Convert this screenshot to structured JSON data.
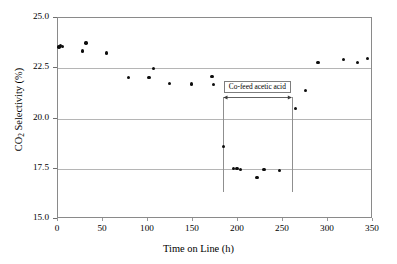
{
  "chart_data": {
    "type": "scatter",
    "title": "",
    "xlabel": "Time on Line (h)",
    "ylabel_parts": {
      "pre": "CO",
      "sub": "2",
      "post": " Selectivity (%)"
    },
    "ylabel": "CO2 Selectivity (%)",
    "xlim": [
      0,
      350
    ],
    "ylim": [
      15.0,
      25.0
    ],
    "xticks": [
      0,
      50,
      100,
      150,
      200,
      250,
      300,
      350
    ],
    "xtick_labels": [
      "0",
      "50",
      "100",
      "150",
      "200",
      "250",
      "300",
      "350"
    ],
    "yticks": [
      15.0,
      17.5,
      20.0,
      22.5,
      25.0
    ],
    "ytick_labels": [
      "15.0",
      "17.5",
      "20.0",
      "22.5",
      "25.0"
    ],
    "grid": "horizontal",
    "legend": "none",
    "marker": "filled-circle",
    "marker_color": "#0d0d0d",
    "gridline_color": "#b5b5b5",
    "axis_color": "#8a8a8a",
    "series": [
      {
        "name": "CO2 Selectivity",
        "points": [
          {
            "x": 1,
            "y": 23.55
          },
          {
            "x": 3,
            "y": 23.62
          },
          {
            "x": 5,
            "y": 23.58
          },
          {
            "x": 27,
            "y": 23.35
          },
          {
            "x": 31,
            "y": 23.75
          },
          {
            "x": 54,
            "y": 23.25
          },
          {
            "x": 78,
            "y": 22.05
          },
          {
            "x": 101,
            "y": 22.05
          },
          {
            "x": 106,
            "y": 22.5
          },
          {
            "x": 124,
            "y": 21.75
          },
          {
            "x": 148,
            "y": 21.72
          },
          {
            "x": 171,
            "y": 22.1
          },
          {
            "x": 173,
            "y": 21.7
          },
          {
            "x": 184,
            "y": 18.6
          },
          {
            "x": 195,
            "y": 17.5
          },
          {
            "x": 199,
            "y": 17.5
          },
          {
            "x": 203,
            "y": 17.45
          },
          {
            "x": 221,
            "y": 17.05
          },
          {
            "x": 229,
            "y": 17.45
          },
          {
            "x": 246,
            "y": 17.4
          },
          {
            "x": 264,
            "y": 20.5
          },
          {
            "x": 275,
            "y": 21.4
          },
          {
            "x": 289,
            "y": 22.8
          },
          {
            "x": 317,
            "y": 22.95
          },
          {
            "x": 333,
            "y": 22.78
          },
          {
            "x": 344,
            "y": 22.98
          }
        ]
      }
    ],
    "annotations": [
      {
        "name": "co-feed-acetic-acid",
        "text": "Co-feed acetic acid",
        "type": "span-with-arrows",
        "x_start": 183,
        "x_end": 260,
        "y_text": 21.55,
        "y_line_top": 21.05,
        "y_line_bottom": 16.35
      }
    ]
  }
}
